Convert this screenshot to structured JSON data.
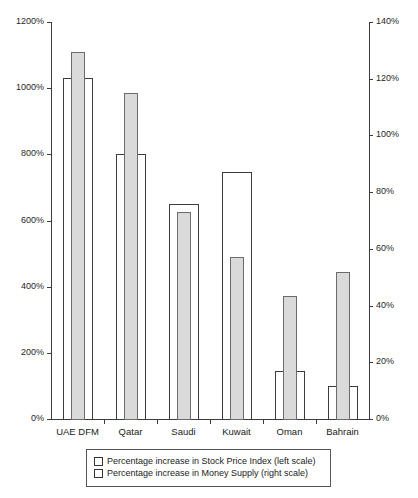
{
  "chart_data": {
    "type": "bar",
    "title": "",
    "subtitle": "",
    "xlabel": "",
    "categories": [
      "UAE DFM",
      "Qatar",
      "Saudi",
      "Kuwait",
      "Oman",
      "Bahrain"
    ],
    "series": [
      {
        "name": "Percentage increase in Stock Price Index (left scale)",
        "axis": "left",
        "style": "white-outline",
        "values": [
          1030,
          800,
          650,
          748,
          145,
          100
        ],
        "unit": "%"
      },
      {
        "name": "Percentage increase in Money Supply (right scale)",
        "axis": "right",
        "style": "gray-fill",
        "values": [
          129.5,
          115,
          73,
          57,
          43.5,
          52
        ],
        "unit": "%"
      }
    ],
    "left_axis": {
      "label": "",
      "ylim": [
        0,
        1200
      ],
      "tick_step": 200,
      "ticks": [
        "0%",
        "200%",
        "400%",
        "600%",
        "800%",
        "1000%",
        "1200%"
      ]
    },
    "right_axis": {
      "label": "",
      "ylim": [
        0,
        140
      ],
      "tick_step": 20,
      "ticks": [
        "0%",
        "20%",
        "40%",
        "60%",
        "80%",
        "100%",
        "120%",
        "140%"
      ]
    },
    "grid": false,
    "legend_position": "bottom",
    "colors": {
      "series_1_fill": "#ffffff",
      "series_1_border": "#3c3c3c",
      "series_2_fill": "#dadada",
      "series_2_border": "#6b6b6b",
      "axis": "#3c3c3c",
      "text": "#1a1a1a",
      "background": "#ffffff"
    }
  },
  "legend": {
    "items": [
      {
        "label": "Percentage increase in Stock Price Index (left scale)"
      },
      {
        "label": "Percentage increase in Money Supply (right scale)"
      }
    ]
  }
}
